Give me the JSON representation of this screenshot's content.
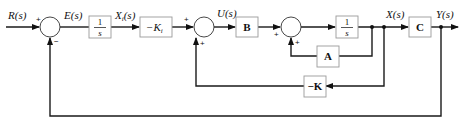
{
  "diagram": {
    "type": "block-diagram",
    "signals": {
      "r": "R(s)",
      "e": "E(s)",
      "xi": "X",
      "xi_sub": "i",
      "xi_tail": "(s)",
      "u": "U(s)",
      "x": "X(s)",
      "y": "Y(s)"
    },
    "blocks": {
      "int1": {
        "num": "1",
        "den": "s"
      },
      "ki": {
        "label": "−K",
        "sub": "i"
      },
      "b": {
        "label": "B"
      },
      "int2": {
        "num": "1",
        "den": "s"
      },
      "c": {
        "label": "C"
      },
      "a": {
        "label": "A"
      },
      "k": {
        "label": "−K"
      }
    },
    "summers": {
      "s1": {
        "top_sign": "+",
        "bottom_sign": "−"
      },
      "s2": {
        "top_sign": "+",
        "bottom_sign": "+"
      },
      "s3": {
        "left_sign": "+",
        "bottom_sign": "+"
      }
    }
  }
}
